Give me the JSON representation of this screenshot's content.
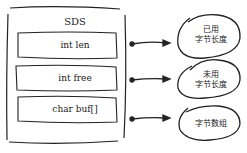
{
  "struct": {
    "title": "SDS",
    "fields": [
      {
        "label": "int len"
      },
      {
        "label": "int free"
      },
      {
        "label": "char buf[]"
      }
    ]
  },
  "annotations": [
    {
      "line1": "已用",
      "line2": "字节长度"
    },
    {
      "line1": "未用",
      "line2": "字节长度"
    },
    {
      "line1": "",
      "line2": "字节数组"
    }
  ],
  "colors": {
    "stroke": "#222222",
    "background": "#ffffff"
  }
}
